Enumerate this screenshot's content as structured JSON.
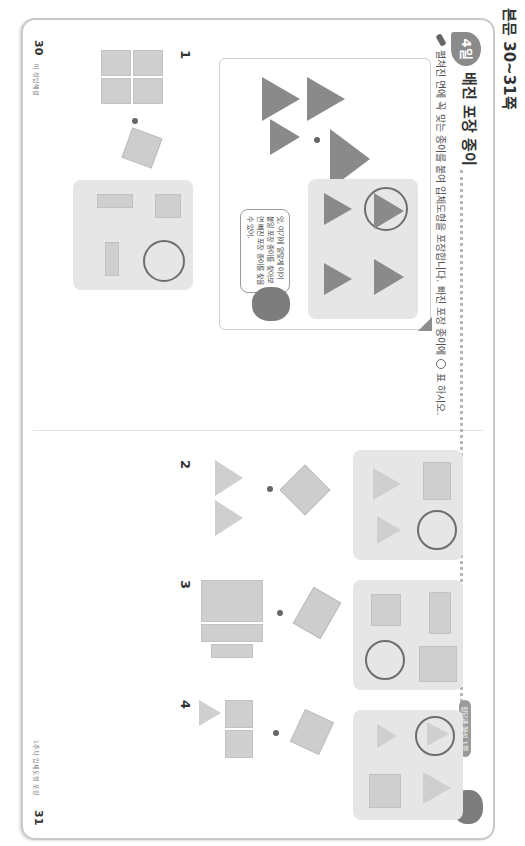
{
  "corner_label": "본문 30~31쪽",
  "left_page": {
    "day_badge": "4일",
    "title": "배진 포장 종이",
    "instruction_prefix": "펼쳐진 면에 꼭 맞는 종이를 붙여 입체도형을 포장합니다. 빠진 포장 종이에",
    "instruction_suffix": "표 하시오.",
    "example": {
      "speech_bubble": "앗, 여기에 알맞게 이어 붙일 포장 종이를 찾아보면 빠진 포장 종이를 찾을 수 있어."
    },
    "question_1_label": "1",
    "page_number": "30",
    "page_caption": "미 정답해설"
  },
  "right_page": {
    "tag": "정답과 해설 1쪽",
    "questions": [
      {
        "label": "2"
      },
      {
        "label": "3"
      },
      {
        "label": "4"
      }
    ],
    "page_number": "31",
    "page_caption": "1주차 입체도형 포장"
  },
  "colors": {
    "shape_fill": "#cfcfcf",
    "dark_shape": "#8a8a8a",
    "panel_bg": "#e6e6e6",
    "ring": "#6e6e6e"
  }
}
